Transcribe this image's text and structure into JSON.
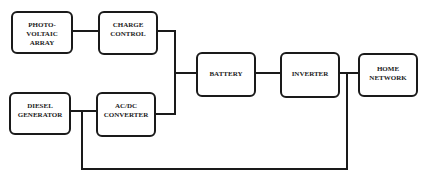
{
  "diagram": {
    "nodes": [
      {
        "id": "pv",
        "label": "PHOTO- VOLTAIC\nARRAY"
      },
      {
        "id": "charge",
        "label": "CHARGE\nCONTROL"
      },
      {
        "id": "diesel",
        "label": "DIESEL\nGENERATOR"
      },
      {
        "id": "acdc",
        "label": "AC/DC\nCONVERTER"
      },
      {
        "id": "battery",
        "label": "BATTERY"
      },
      {
        "id": "inverter",
        "label": "INVERTER"
      },
      {
        "id": "home",
        "label": "HOME\nNETWORK"
      }
    ],
    "edges": [
      {
        "from": "pv",
        "to": "charge"
      },
      {
        "from": "charge",
        "to": "battery"
      },
      {
        "from": "diesel",
        "to": "acdc"
      },
      {
        "from": "acdc",
        "to": "battery"
      },
      {
        "from": "battery",
        "to": "inverter"
      },
      {
        "from": "inverter",
        "to": "home"
      },
      {
        "from": "diesel",
        "to": "home"
      }
    ],
    "colors": {
      "stroke": "#1a1a1a",
      "text": "#222222",
      "background": "#ffffff"
    }
  }
}
